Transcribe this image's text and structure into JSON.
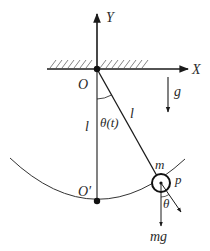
{
  "diagram": {
    "type": "simple-pendulum",
    "labels": {
      "y_axis": "Y",
      "x_axis": "X",
      "origin": "O",
      "gravity": "g",
      "length_left": "l",
      "length_rod": "l",
      "angle": "θ(t)",
      "lowest_point": "O′",
      "mass": "m",
      "point": "p",
      "angle_small": "θ",
      "weight": "mg"
    },
    "colors": {
      "line": "#1a1a1a",
      "hatch": "#555555",
      "text": "#2a2a2a"
    }
  }
}
